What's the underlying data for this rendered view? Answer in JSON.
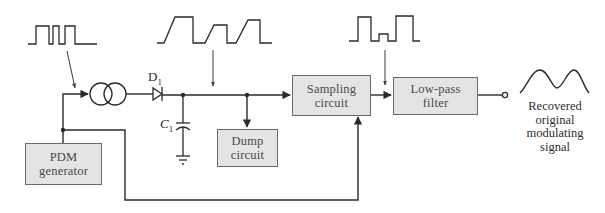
{
  "diagram": {
    "blocks": {
      "pdm_generator": {
        "line1": "PDM",
        "line2": "generator"
      },
      "dump_circuit": {
        "line1": "Dump",
        "line2": "circuit"
      },
      "sampling_circuit": {
        "line1": "Sampling",
        "line2": "circuit"
      },
      "low_pass_filter": {
        "line1": "Low-pass",
        "line2": "filter"
      }
    },
    "components": {
      "diode": {
        "label": "D",
        "subscript": "1"
      },
      "capacitor": {
        "label": "C",
        "subscript": "1"
      },
      "current_source": {
        "label": ""
      },
      "ground": {
        "label": ""
      }
    },
    "waveforms": [
      {
        "id": "pdm-input",
        "description": "PDM pulse train (variable-width pulses)"
      },
      {
        "id": "ramp-output",
        "description": "Ramp waveform at capacitor C1"
      },
      {
        "id": "sampled-output",
        "description": "Sampled pulse-amplitude waveform"
      },
      {
        "id": "recovered-signal",
        "description": "Smooth recovered modulating signal"
      }
    ],
    "output_caption": {
      "line1": "Recovered",
      "line2": "original",
      "line3": "modulating",
      "line4": "signal"
    },
    "colors": {
      "wire": "#2a2a2a",
      "block_fill": "#e4e4e4",
      "block_border": "#6a6a6a",
      "background": "#ffffff"
    }
  }
}
